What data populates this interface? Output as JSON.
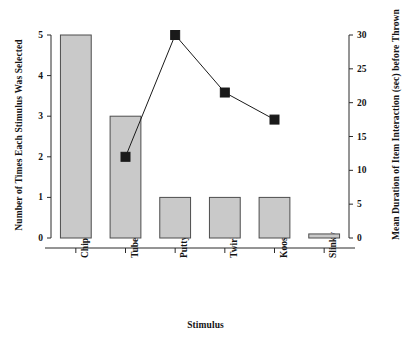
{
  "chart_data": {
    "type": "bar",
    "title": "",
    "xlabel": "Stimulus",
    "categories": [
      "Chips",
      "Tube",
      "Putty",
      "Twirling toy",
      "Koosh ball",
      "Slinky"
    ],
    "grid": false,
    "legend": "none",
    "axes": {
      "left": {
        "label": "Number of Times Each Stimulus Was Selected",
        "ylim": [
          0,
          5
        ],
        "ticks": [
          0,
          1,
          2,
          3,
          4,
          5
        ],
        "tick_labels": [
          "0",
          "1",
          "2",
          "3",
          "4",
          "5"
        ]
      },
      "right": {
        "label": "Mean Duration of Item Interaction (sec) before Thrown",
        "ylim": [
          0,
          30
        ],
        "ticks": [
          0,
          5,
          10,
          15,
          20,
          25,
          30
        ],
        "tick_labels": [
          "0",
          "5",
          "10",
          "15",
          "20",
          "25",
          "30"
        ]
      }
    },
    "series": [
      {
        "name": "Number of Times Each Stimulus Was Selected",
        "type": "bar",
        "axis": "left",
        "color": "#c9c9c9",
        "edge_color": "#4d4d4d",
        "values": [
          5,
          3,
          1,
          1,
          1,
          0.1
        ]
      },
      {
        "name": "Mean Duration of Item Interaction (sec) before Thrown",
        "type": "line",
        "axis": "right",
        "color": "#1a1a1a",
        "marker": "square",
        "values": [
          null,
          12,
          30,
          21.5,
          17.5,
          null
        ]
      }
    ]
  }
}
